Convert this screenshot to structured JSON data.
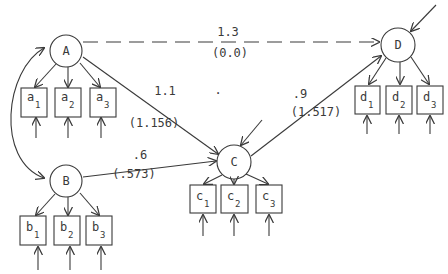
{
  "diagram": {
    "type": "structural-equation-path-diagram",
    "colors": {
      "ink": "#3a3a3a",
      "background": "#ffffff"
    },
    "latent_factors": [
      {
        "id": "A",
        "label": "A",
        "cx": 66,
        "cy": 51,
        "r": 16
      },
      {
        "id": "B",
        "label": "B",
        "cx": 66,
        "cy": 181,
        "r": 16
      },
      {
        "id": "C",
        "label": "C",
        "cx": 234,
        "cy": 162,
        "r": 17
      },
      {
        "id": "D",
        "label": "D",
        "cx": 398,
        "cy": 45,
        "r": 17
      }
    ],
    "indicators": [
      {
        "id": "a1",
        "letter": "a",
        "sub": "1",
        "x": 21,
        "y": 88,
        "factor": "A"
      },
      {
        "id": "a2",
        "letter": "a",
        "sub": "2",
        "x": 55,
        "y": 88,
        "factor": "A"
      },
      {
        "id": "a3",
        "letter": "a",
        "sub": "3",
        "x": 90,
        "y": 88,
        "factor": "A"
      },
      {
        "id": "b1",
        "letter": "b",
        "sub": "1",
        "x": 20,
        "y": 216,
        "factor": "B"
      },
      {
        "id": "b2",
        "letter": "b",
        "sub": "2",
        "x": 54,
        "y": 216,
        "factor": "B"
      },
      {
        "id": "b3",
        "letter": "b",
        "sub": "3",
        "x": 86,
        "y": 216,
        "factor": "B"
      },
      {
        "id": "c1",
        "letter": "c",
        "sub": "1",
        "x": 190,
        "y": 185,
        "factor": "C"
      },
      {
        "id": "c2",
        "letter": "c",
        "sub": "2",
        "x": 221,
        "y": 185,
        "factor": "C"
      },
      {
        "id": "c3",
        "letter": "c",
        "sub": "3",
        "x": 256,
        "y": 185,
        "factor": "C"
      },
      {
        "id": "d1",
        "letter": "d",
        "sub": "1",
        "x": 355,
        "y": 86,
        "factor": "D"
      },
      {
        "id": "d2",
        "letter": "d",
        "sub": "2",
        "x": 386,
        "y": 86,
        "factor": "D"
      },
      {
        "id": "d3",
        "letter": "d",
        "sub": "3",
        "x": 417,
        "y": 86,
        "factor": "D"
      }
    ],
    "paths": [
      {
        "from": "A",
        "to": "D",
        "style": "dashed",
        "coefficient": "1.3",
        "estimate": "(0.0)"
      },
      {
        "from": "A",
        "to": "C",
        "style": "solid",
        "coefficient": "1.1",
        "estimate": "(1.156)"
      },
      {
        "from": "B",
        "to": "C",
        "style": "solid",
        "coefficient": ".6",
        "estimate": "(.573)"
      },
      {
        "from": "C",
        "to": "D",
        "style": "solid",
        "coefficient": ".9",
        "estimate": "(1.517)"
      },
      {
        "from": "A",
        "to": "B",
        "style": "curved-double-headed",
        "coefficient": "",
        "estimate": ""
      }
    ],
    "stray_mark": "."
  }
}
